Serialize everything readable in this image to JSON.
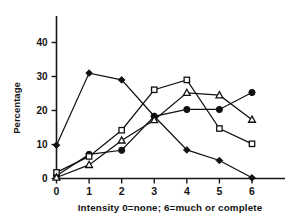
{
  "chart_data": {
    "type": "line",
    "title": "",
    "subtitle": "",
    "xlabel": "Intensity 0=none;  6=much or complete",
    "ylabel": "Percentage",
    "x": [
      0,
      1,
      2,
      3,
      4,
      5,
      6
    ],
    "categories": [
      "0",
      "1",
      "2",
      "3",
      "4",
      "5",
      "6"
    ],
    "xlim": [
      0,
      6
    ],
    "ylim": [
      0,
      47
    ],
    "grid": false,
    "legend": "none",
    "y_ticks": [
      0,
      10,
      20,
      30,
      40
    ],
    "y_tick_labels": [
      "0",
      "10",
      "20",
      "30",
      "40"
    ],
    "x_ticks": [
      0,
      1,
      2,
      3,
      4,
      5,
      6
    ],
    "x_tick_labels": [
      "0",
      "1",
      "2",
      "3",
      "4",
      "5",
      "6"
    ],
    "series": [
      {
        "name": "filled-diamond",
        "marker": "filled-diamond",
        "values": [
          9.8,
          31.0,
          29.0,
          18.3,
          8.4,
          5.3,
          0.2
        ]
      },
      {
        "name": "filled-circle",
        "marker": "filled-circle",
        "values": [
          0.8,
          7.1,
          8.3,
          18.3,
          20.3,
          20.3,
          25.3
        ]
      },
      {
        "name": "open-square",
        "marker": "open-square",
        "values": [
          1.8,
          6.5,
          14.2,
          26.1,
          29.0,
          14.7,
          10.2
        ]
      },
      {
        "name": "open-triangle",
        "marker": "open-triangle",
        "values": [
          0.3,
          4.0,
          11.2,
          17.2,
          25.2,
          24.5,
          17.3
        ]
      }
    ]
  },
  "axis": {
    "y_label": "Percentage",
    "x_caption": "Intensity 0=none;  6=much or complete"
  },
  "colors": {
    "ink": "#111111",
    "background": "#ffffff"
  }
}
